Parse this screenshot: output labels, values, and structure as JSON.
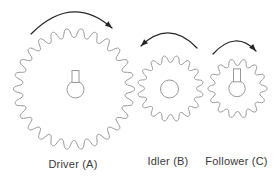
{
  "diagram": {
    "type": "gear-train",
    "background_color": "#ffffff",
    "gear_stroke_color": "#9a9a9a",
    "gear_fill_color": "#ffffff",
    "arrow_color": "#262626",
    "label_color": "#3a3a3a",
    "gears": [
      {
        "name": "driver",
        "label": "Driver (A)",
        "role": "Driver",
        "cx": 74,
        "cy": 89,
        "teeth": 26,
        "tip_radius": 60.5,
        "root_radius": 51.5,
        "phase_deg": 0,
        "rotation": "clockwise",
        "hub": {
          "type": "keyed-shaft",
          "cx": 75.5,
          "cy": 89.5,
          "circle_radius": 8.5,
          "key_width": 7,
          "key_height": 12
        }
      },
      {
        "name": "idler",
        "label": "Idler (B)",
        "role": "Idler",
        "cx": 170.5,
        "cy": 88.5,
        "teeth": 16,
        "tip_radius": 33,
        "root_radius": 26,
        "phase_deg": 180,
        "rotation": "counter-clockwise",
        "hub": {
          "type": "plain-bore",
          "cx": 169.5,
          "cy": 89,
          "circle_radius": 9
        }
      },
      {
        "name": "follower",
        "label": "Follower (C)",
        "role": "Follower",
        "cx": 237.5,
        "cy": 88.5,
        "teeth": 14,
        "tip_radius": 29.5,
        "root_radius": 23,
        "phase_deg": 0,
        "rotation": "clockwise",
        "hub": {
          "type": "keyed-shaft",
          "cx": 237,
          "cy": 88.5,
          "circle_radius": 8.2,
          "key_width": 7,
          "key_height": 13
        }
      }
    ],
    "arrows": [
      {
        "name": "driver-rotation-arrow",
        "direction": "clockwise",
        "start": {
          "x": 31,
          "y": 34
        },
        "control": {
          "x": 72,
          "y": -7
        },
        "end": {
          "x": 112,
          "y": 28
        }
      },
      {
        "name": "idler-rotation-arrow",
        "direction": "counter-clockwise",
        "start": {
          "x": 197,
          "y": 48
        },
        "control": {
          "x": 169,
          "y": 19
        },
        "end": {
          "x": 141,
          "y": 46
        }
      },
      {
        "name": "follower-rotation-arrow",
        "direction": "clockwise",
        "start": {
          "x": 213,
          "y": 54
        },
        "control": {
          "x": 235.5,
          "y": 29.5
        },
        "end": {
          "x": 256,
          "y": 51
        }
      }
    ],
    "labels": [
      {
        "name": "driver-label",
        "text": "Driver (A)",
        "cx": 73,
        "top": 158
      },
      {
        "name": "idler-label",
        "text": "Idler (B)",
        "cx": 168,
        "top": 155
      },
      {
        "name": "follower-label",
        "text": "Follower (C)",
        "cx": 236.5,
        "top": 155
      }
    ]
  }
}
